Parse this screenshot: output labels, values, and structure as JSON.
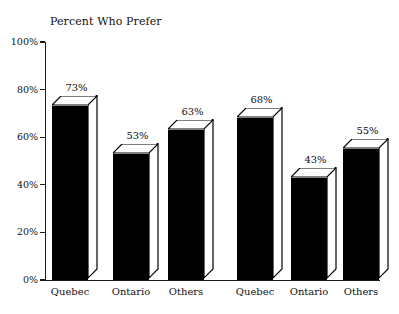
{
  "chart_data": {
    "type": "bar",
    "title": "Percent Who Prefer",
    "xlabel": "",
    "ylabel": "",
    "ylim": [
      0,
      100
    ],
    "ytick_labels": [
      "0%",
      "20%",
      "40%",
      "60%",
      "80%",
      "100%"
    ],
    "ytick_values": [
      0,
      20,
      40,
      60,
      80,
      100
    ],
    "grid": false,
    "legend": "none",
    "categories": [
      "Quebec",
      "Ontario",
      "Others"
    ],
    "groups": [
      {
        "name": "Group 1",
        "categories": [
          "Quebec",
          "Ontario",
          "Others"
        ],
        "values": [
          73,
          53,
          63
        ],
        "value_labels": [
          "73%",
          "53%",
          "63%"
        ]
      },
      {
        "name": "Group 2",
        "categories": [
          "Quebec",
          "Ontario",
          "Others"
        ],
        "values": [
          68,
          43,
          55
        ],
        "value_labels": [
          "68%",
          "43%",
          "55%"
        ]
      }
    ],
    "series": [
      {
        "name": "Group 1",
        "values": [
          73,
          53,
          63
        ]
      },
      {
        "name": "Group 2",
        "values": [
          68,
          43,
          55
        ]
      }
    ],
    "style": {
      "bar_fill": "#000000",
      "bar_outline": "#000000",
      "bar_top_face": "#ffffff",
      "bar_side_face": "#ffffff",
      "background": "#ffffff",
      "axis_color": "#1a1a1a",
      "three_d": true
    }
  },
  "axis": {
    "ticks": [
      {
        "label": "100%",
        "value": 100
      },
      {
        "label": "80%",
        "value": 80
      },
      {
        "label": "60%",
        "value": 60
      },
      {
        "label": "40%",
        "value": 40
      },
      {
        "label": "20%",
        "value": 20
      },
      {
        "label": "0%",
        "value": 0
      }
    ]
  },
  "bars": [
    {
      "id": "g1-quebec",
      "group": 1,
      "category": "Quebec",
      "value": 73,
      "value_label": "73%"
    },
    {
      "id": "g1-ontario",
      "group": 1,
      "category": "Ontario",
      "value": 53,
      "value_label": "53%"
    },
    {
      "id": "g1-others",
      "group": 1,
      "category": "Others",
      "value": 63,
      "value_label": "63%"
    },
    {
      "id": "g2-quebec",
      "group": 2,
      "category": "Quebec",
      "value": 68,
      "value_label": "68%"
    },
    {
      "id": "g2-ontario",
      "group": 2,
      "category": "Ontario",
      "value": 43,
      "value_label": "43%"
    },
    {
      "id": "g2-others",
      "group": 2,
      "category": "Others",
      "value": 55,
      "value_label": "55%"
    }
  ],
  "category_labels": [
    {
      "text": "Quebec"
    },
    {
      "text": "Ontario"
    },
    {
      "text": "Others"
    },
    {
      "text": "Quebec"
    },
    {
      "text": "Ontario"
    },
    {
      "text": "Others"
    }
  ]
}
